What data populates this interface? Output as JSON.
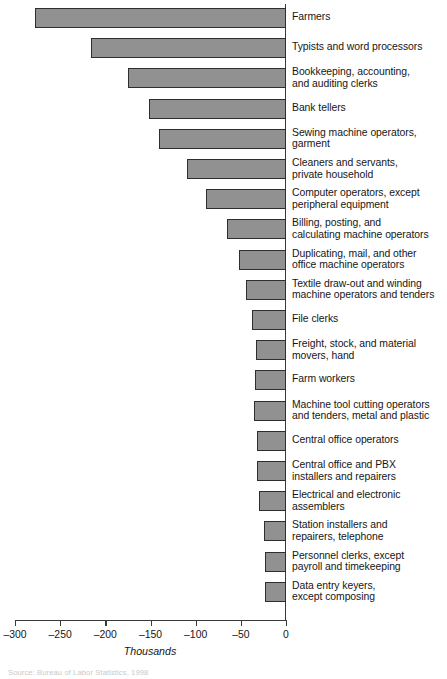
{
  "chart_data": {
    "type": "bar",
    "orientation": "horizontal",
    "title": "",
    "subtitle": "",
    "xlabel": "Thousands",
    "ylabel": "",
    "xlim": [
      -300,
      0
    ],
    "xticks": [
      -300,
      -250,
      -200,
      -150,
      -100,
      -50,
      0
    ],
    "xtick_labels": [
      "-300",
      "-250",
      "-200",
      "-150",
      "-100",
      "-50",
      "0"
    ],
    "grid": false,
    "legend": null,
    "bar_color": "#919191",
    "bar_edge_color": "#2e2e2e",
    "axis_color": "#3a3a3a",
    "units": "thousands of jobs",
    "categories": [
      "Farmers",
      "Typists and word processors",
      "Bookkeeping, accounting,\nand auditing clerks",
      "Bank tellers",
      "Sewing machine operators,\ngarment",
      "Cleaners and servants,\nprivate household",
      "Computer operators, except\nperipheral equipment",
      "Billing, posting, and\ncalculating machine operators",
      "Duplicating, mail, and other\noffice machine operators",
      "Textile draw-out and winding\nmachine operators and tenders",
      "File clerks",
      "Freight, stock, and material\nmovers, hand",
      "Farm workers",
      "Machine tool cutting operators\nand tenders, metal and plastic",
      "Central office operators",
      "Central office and PBX\ninstallers and repairers",
      "Electrical and electronic\nassemblers",
      "Station installers and\nrepairers, telephone",
      "Personnel clerks, except\npayroll and timekeeping",
      "Data entry keyers,\nexcept composing"
    ],
    "values": [
      -278,
      -216,
      -175,
      -152,
      -141,
      -110,
      -89,
      -65,
      -52,
      -44,
      -38,
      -33,
      -34,
      -35,
      -32,
      -32,
      -30,
      -24,
      -23,
      -23
    ]
  },
  "footer": {
    "source": "Source: Bureau of Labor Statistics, 1998"
  }
}
